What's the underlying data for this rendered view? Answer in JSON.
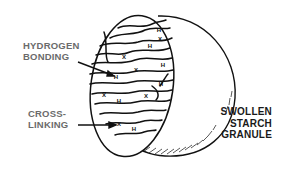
{
  "diagram": {
    "title": "Swollen starch granule",
    "colors": {
      "line": "#111111",
      "label_gray": "#6b6b6b",
      "label_dark": "#1a1a1a",
      "background": "#ffffff"
    },
    "labels": {
      "hydrogen_bonding": {
        "line1": "HYDROGEN",
        "line2": "BONDING"
      },
      "cross_linking": {
        "line1": "CROSS-",
        "line2": "LINKING"
      },
      "granule": {
        "line1": "SWOLLEN",
        "line2": "STARCH",
        "line3": "GRANULE"
      }
    },
    "markers": {
      "hydrogen_symbol": "H",
      "crosslink_symbol": "X"
    }
  }
}
